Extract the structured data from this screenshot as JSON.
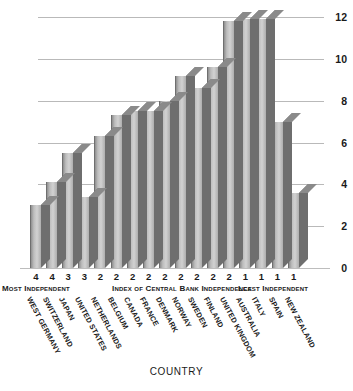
{
  "chart_data": {
    "type": "bar",
    "title": "",
    "xlabel": "COUNTRY",
    "ylabel": "",
    "ylim": [
      0,
      12
    ],
    "yticks": [
      0,
      2,
      4,
      6,
      8,
      10,
      12
    ],
    "grid": true,
    "legend": null,
    "categories": [
      "WEST GERMANY",
      "SWITZERLAND",
      "JAPAN",
      "UNITED STATES",
      "NETHERLANDS",
      "BELGIUM",
      "CANADA",
      "FRANCE",
      "DENMARK",
      "NORWAY",
      "SWEDEN",
      "FINLAND",
      "UNITED KINGDOM",
      "AUSTRALIA",
      "ITALY",
      "SPAIN",
      "NEW ZEALAND"
    ],
    "values": [
      3.0,
      4.1,
      5.5,
      3.4,
      6.3,
      7.3,
      7.5,
      7.5,
      8.0,
      9.2,
      8.6,
      9.6,
      11.8,
      11.9,
      11.9,
      7.0,
      3.6
    ],
    "index_values": [
      4,
      4,
      3,
      3,
      2,
      2,
      2,
      2,
      2,
      2,
      2,
      2,
      2,
      1,
      1,
      1,
      1
    ],
    "annotations": [
      "Most Independent",
      "Index of Central Bank Independence",
      "Least Independent"
    ]
  },
  "style": {
    "bar_front": "#cfcfcf",
    "bar_side": "#6e6e6e",
    "bar_top": "#8a8a8a",
    "gridline": "#b9b9b9",
    "background": "#ffffff",
    "text": "#1a1a1a"
  }
}
